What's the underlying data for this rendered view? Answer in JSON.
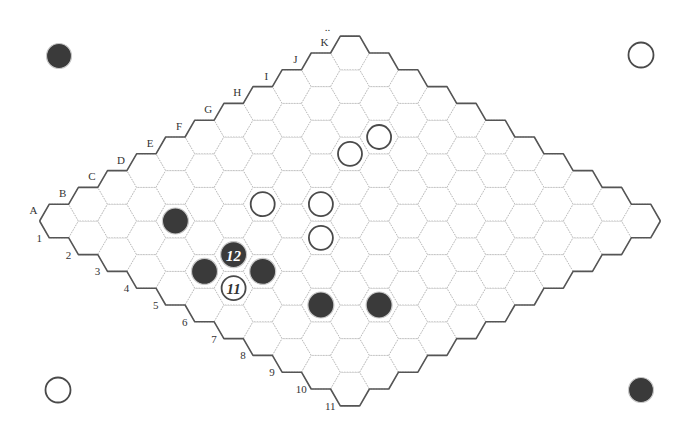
{
  "game": "Hex",
  "board": {
    "size": 11,
    "column_labels": [
      "A",
      "B",
      "C",
      "D",
      "E",
      "F",
      "G",
      "H",
      "I",
      "J",
      "K"
    ],
    "row_labels": [
      "1",
      "2",
      "3",
      "4",
      "5",
      "6",
      "7",
      "8",
      "9",
      "10",
      "11"
    ],
    "top_marker": "..",
    "geometry": {
      "origin_x": 59,
      "origin_y": 221,
      "step_x": 29.1,
      "step_y": 16.8,
      "hex_radius": 19.4
    }
  },
  "colors": {
    "black_stone": "#3a3a3a",
    "white_stone_stroke": "#4a4a4a",
    "edge": "#555555",
    "grid": "#b9b9b9",
    "background": "#ffffff"
  },
  "corner_markers": [
    {
      "position": "top-left",
      "color": "black",
      "x": 59,
      "y": 56
    },
    {
      "position": "top-right",
      "color": "white",
      "x": 641,
      "y": 55
    },
    {
      "position": "bottom-left",
      "color": "white",
      "x": 58,
      "y": 390
    },
    {
      "position": "bottom-right",
      "color": "black",
      "x": 641,
      "y": 390
    }
  ],
  "stones": [
    {
      "cell": "C3",
      "col": 2,
      "row": 2,
      "color": "black",
      "label": ""
    },
    {
      "cell": "E4",
      "col": 4,
      "row": 3,
      "color": "white",
      "label": ""
    },
    {
      "cell": "F5",
      "col": 5,
      "row": 4,
      "color": "white",
      "label": ""
    },
    {
      "cell": "E6",
      "col": 4,
      "row": 5,
      "color": "white",
      "label": ""
    },
    {
      "cell": "H4",
      "col": 7,
      "row": 3,
      "color": "white",
      "label": ""
    },
    {
      "cell": "I4",
      "col": 8,
      "row": 3,
      "color": "white",
      "label": ""
    },
    {
      "cell": "C5",
      "col": 2,
      "row": 4,
      "color": "black",
      "label": "12"
    },
    {
      "cell": "B5",
      "col": 1,
      "row": 4,
      "color": "black",
      "label": ""
    },
    {
      "cell": "C6",
      "col": 2,
      "row": 5,
      "color": "black",
      "label": ""
    },
    {
      "cell": "B6",
      "col": 1,
      "row": 5,
      "color": "white",
      "label": "11"
    },
    {
      "cell": "C8",
      "col": 2,
      "row": 7,
      "color": "black",
      "label": ""
    },
    {
      "cell": "D9",
      "col": 3,
      "row": 8,
      "color": "black",
      "label": ""
    }
  ]
}
